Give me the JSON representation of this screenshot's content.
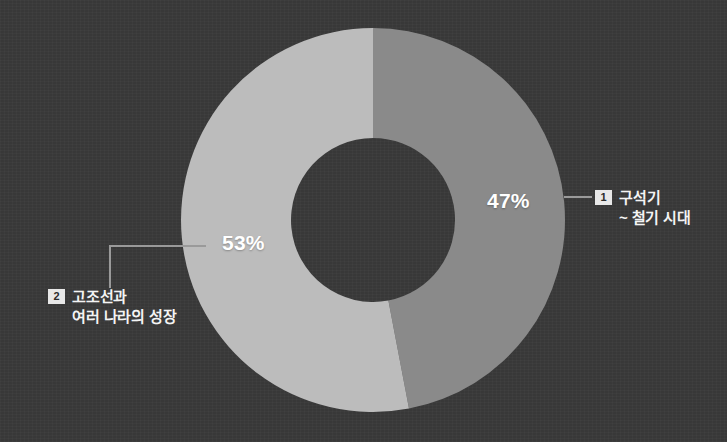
{
  "canvas": {
    "width": 727,
    "height": 442,
    "background_color": "#3a3a3a"
  },
  "chart_data": {
    "type": "pie",
    "variant": "donut",
    "title": "",
    "subtitle": "",
    "categories": [
      "구석기 ~ 철기 시대",
      "고조선과 여러 나라의 성장"
    ],
    "values": [
      47,
      53
    ],
    "value_unit": "%",
    "data_labels": [
      "47%",
      "53%"
    ],
    "colors": [
      "#8a8a8a",
      "#bcbcbc"
    ],
    "legend": {
      "position": "callout",
      "entries": [
        {
          "index": "1",
          "label_line_1": "구석기",
          "label_line_2": "~ 철기 시대"
        },
        {
          "index": "2",
          "label_line_1": "고조선과",
          "label_line_2": "여러 나라의 성장"
        }
      ]
    },
    "geometry": {
      "center_x": 373,
      "center_y": 220,
      "outer_radius": 192,
      "inner_radius": 82,
      "start_angle_deg": 0,
      "direction": "clockwise"
    },
    "grid": false,
    "xlabel": "",
    "ylabel": ""
  },
  "slices": [
    {
      "id": "slice-1",
      "index_badge": "1",
      "percent_label": "47%",
      "value": 47,
      "color": "#8a8a8a",
      "name_line_1": "구석기",
      "name_line_2": "~ 철기 시대"
    },
    {
      "id": "slice-2",
      "index_badge": "2",
      "percent_label": "53%",
      "value": 53,
      "color": "#bcbcbc",
      "name_line_1": "고조선과",
      "name_line_2": "여러 나라의 성장"
    }
  ],
  "colors": {
    "background": "#3a3a3a",
    "slice_1": "#8a8a8a",
    "slice_2": "#bcbcbc",
    "hole": "#3a3a3a",
    "label_text": "#f4f4f4",
    "value_text": "#ffffff",
    "badge_bg": "#e8e8e8",
    "badge_text": "#2b2b2b",
    "leader_line": "#9a9a9a"
  },
  "watermark": {
    "text": "미리보기"
  }
}
